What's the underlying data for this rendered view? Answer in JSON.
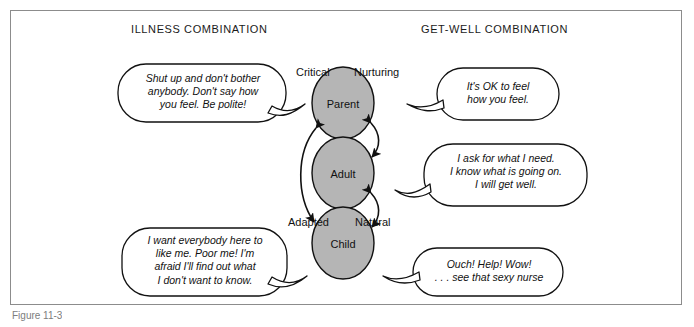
{
  "figure": {
    "headers": {
      "left": "ILLNESS COMBINATION",
      "right": "GET-WELL COMBINATION"
    },
    "caption": "Figure 11-3",
    "colors": {
      "ego_state_fill": "#b5b5b5",
      "stroke": "#111111",
      "frame": "#8c8c8c",
      "background": "#ffffff"
    },
    "ego_states": [
      {
        "name": "Parent",
        "left_qualifier": "Critical",
        "right_qualifier": "Nurturing"
      },
      {
        "name": "Adult",
        "left_qualifier": "",
        "right_qualifier": ""
      },
      {
        "name": "Child",
        "left_qualifier": "Adapted",
        "right_qualifier": "Natural"
      }
    ],
    "bubbles": [
      {
        "id": "parent-illness",
        "side": "left",
        "target": "Parent",
        "text": "Shut up and don't bother\nanybody. Don't say how\nyou feel. Be polite!"
      },
      {
        "id": "parent-getwell",
        "side": "right",
        "target": "Parent",
        "text": "It's OK to feel\nhow you feel."
      },
      {
        "id": "adult-getwell",
        "side": "right",
        "target": "Adult",
        "text": "I ask for what I need.\nI know what is going on.\nI will get well."
      },
      {
        "id": "child-illness",
        "side": "left",
        "target": "Child",
        "text": "I want everybody here to\nlike me. Poor me! I'm\nafraid I'll find out what\nI don't want to know."
      },
      {
        "id": "child-getwell",
        "side": "right",
        "target": "Child",
        "text": "Ouch! Help! Wow!\n. . . see that sexy nurse"
      }
    ],
    "arrows": [
      {
        "id": "arrow-parent-child-left",
        "from": "Child",
        "to": "Parent",
        "style": "double-headed-curve",
        "side": "left"
      },
      {
        "id": "arrow-parent-adult-right",
        "from": "Parent",
        "to": "Adult",
        "style": "double-headed-curve",
        "side": "right"
      },
      {
        "id": "arrow-adult-child-right",
        "from": "Adult",
        "to": "Child",
        "style": "double-headed-curve",
        "side": "right"
      }
    ]
  }
}
